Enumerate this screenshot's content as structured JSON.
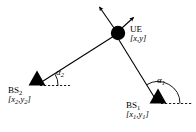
{
  "figure": {
    "type": "geometry-diagram",
    "width": 196,
    "height": 132,
    "background_color": "#ffffff",
    "stroke_color": "#000000"
  },
  "nodes": {
    "ue": {
      "label": "UE",
      "coordinate_label": "[x,y]",
      "coord_x_var": "x",
      "coord_y_var": "y",
      "shape": "filled-circle",
      "x": 118,
      "y": 33,
      "radius": 7
    },
    "bs1": {
      "label": "BS",
      "subscript": "1",
      "coordinate_open": "[",
      "coord_x_var": "x",
      "coord_x_sub": "1",
      "coord_sep": ",",
      "coord_y_var": "y",
      "coord_y_sub": "1",
      "coordinate_close": "]",
      "shape": "filled-triangle",
      "x": 158,
      "y": 103
    },
    "bs2": {
      "label": "BS",
      "subscript": "2",
      "coordinate_open": "[",
      "coord_x_var": "x",
      "coord_x_sub": "2",
      "coord_sep": ",",
      "coord_y_var": "y",
      "coord_y_sub": "2",
      "coordinate_close": "]",
      "shape": "filled-triangle",
      "x": 37,
      "y": 85
    }
  },
  "angles": {
    "alpha1": {
      "symbol": "α",
      "subscript": "1",
      "at_node": "bs1",
      "arc_start_deg": 0,
      "arc_end_deg": 121,
      "arc_radius": 22
    },
    "alpha2": {
      "symbol": "α",
      "subscript": "2",
      "at_node": "bs2",
      "arc_start_deg": 0,
      "arc_end_deg": 31,
      "arc_radius": 20
    }
  },
  "edges": [
    {
      "name": "bs2-to-ue",
      "from": "bs2",
      "to": "ue",
      "style": "solid"
    },
    {
      "name": "bs1-to-ue",
      "from": "bs1",
      "to": "ue",
      "style": "solid"
    }
  ],
  "dashed_reference_lines": [
    {
      "name": "bs2-horizontal-reference",
      "x1": 38,
      "y1": 85,
      "x2": 70,
      "y2": 85
    },
    {
      "name": "bs1-horizontal-reference",
      "x1": 160,
      "y1": 103,
      "x2": 192,
      "y2": 103
    }
  ],
  "motion_arrows": [
    {
      "name": "ue-velocity-arrow-upleft",
      "x1": 114,
      "y1": 28,
      "x2": 99,
      "y2": 6
    },
    {
      "name": "ue-velocity-arrow-upright",
      "x1": 122,
      "y1": 28,
      "x2": 134,
      "y2": 17
    }
  ]
}
